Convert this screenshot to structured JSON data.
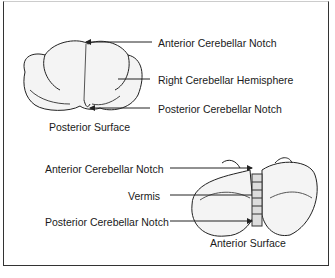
{
  "figure": {
    "top_view": {
      "caption": "Posterior Surface",
      "labels": [
        {
          "text": "Anterior Cerebellar Notch"
        },
        {
          "text": "Right Cerebellar Hemisphere"
        },
        {
          "text": "Posterior Cerebellar Notch"
        }
      ]
    },
    "bottom_view": {
      "caption": "Anterior Surface",
      "labels": [
        {
          "text": "Anterior Cerebellar Notch"
        },
        {
          "text": "Vermis"
        },
        {
          "text": "Posterior Cerebellar Notch"
        }
      ]
    }
  }
}
